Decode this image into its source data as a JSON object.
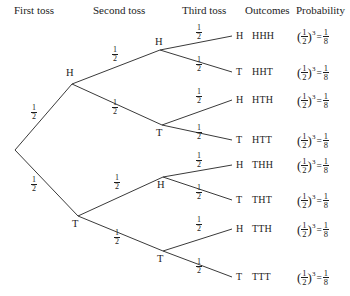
{
  "diagram": {
    "line_color": "#3a3a3a",
    "background": "#ffffff",
    "text_color": "#1d1d1d"
  },
  "headers": {
    "first": "First toss",
    "second": "Second toss",
    "third": "Third toss",
    "outcomes": "Outcomes",
    "probability": "Probability"
  },
  "branch_probability": {
    "numerator": "1",
    "denominator": "2",
    "label": "1/2"
  },
  "nodes": {
    "level1": [
      {
        "id": "H",
        "label": "H"
      },
      {
        "id": "T",
        "label": "T"
      }
    ],
    "level2": [
      {
        "id": "HH",
        "label": "H"
      },
      {
        "id": "HT",
        "label": "T"
      },
      {
        "id": "TH",
        "label": "H"
      },
      {
        "id": "TT",
        "label": "T"
      }
    ]
  },
  "leaves": [
    {
      "letter": "H",
      "outcome": "HHH"
    },
    {
      "letter": "T",
      "outcome": "HHT"
    },
    {
      "letter": "H",
      "outcome": "HTH"
    },
    {
      "letter": "T",
      "outcome": "HTT"
    },
    {
      "letter": "H",
      "outcome": "THH"
    },
    {
      "letter": "T",
      "outcome": "THT"
    },
    {
      "letter": "H",
      "outcome": "TTH"
    },
    {
      "letter": "T",
      "outcome": "TTT"
    }
  ],
  "probability_expression": {
    "base_num": "1",
    "base_den": "2",
    "exponent": "3",
    "equals": "=",
    "result_num": "1",
    "result_den": "8",
    "plain": "(1/2)^3 = 1/8"
  },
  "edge_labels_count": 14
}
